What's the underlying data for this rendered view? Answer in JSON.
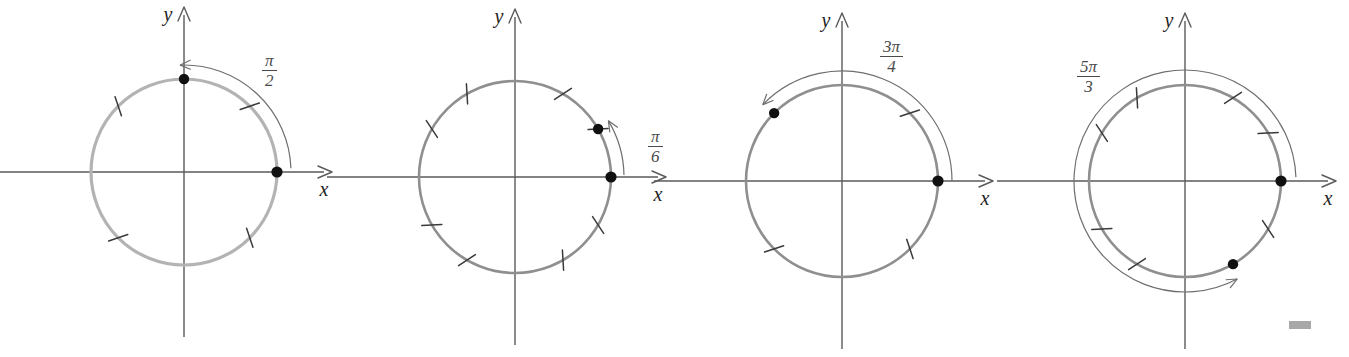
{
  "figure": {
    "background_color": "#ffffff",
    "axis_color": "#5a5a5a",
    "circle_color": "#b3b3b3",
    "point_color": "#111111",
    "arc_color": "#6e6e6e"
  },
  "panels": [
    {
      "id": "panel-1",
      "x_axis_label": "x",
      "y_axis_label": "y",
      "angle_numerator": "π",
      "angle_denominator": "2",
      "angle_label": "π/2",
      "angle_degrees": 90,
      "direction": "counterclockwise",
      "tick_degrees": [
        45,
        135,
        225,
        315
      ],
      "points_degrees": [
        0,
        90
      ],
      "center": {
        "x": 184,
        "y": 172
      },
      "radius": 93,
      "label_position": {
        "x": 262,
        "y": 52
      }
    },
    {
      "id": "panel-2",
      "x_axis_label": "x",
      "y_axis_label": "y",
      "angle_numerator": "π",
      "angle_denominator": "6",
      "angle_label": "π/6",
      "angle_degrees": 30,
      "direction": "counterclockwise",
      "tick_degrees": [
        30,
        60,
        120,
        150,
        210,
        240,
        300,
        330
      ],
      "points_degrees": [
        0,
        30
      ],
      "center": {
        "x": 515,
        "y": 177
      },
      "radius": 96,
      "label_position": {
        "x": 648,
        "y": 128
      }
    },
    {
      "id": "panel-3",
      "x_axis_label": "x",
      "y_axis_label": "y",
      "angle_numerator": "3π",
      "angle_denominator": "4",
      "angle_label": "3π/4",
      "angle_degrees": 135,
      "direction": "counterclockwise",
      "tick_degrees": [
        45,
        225,
        315
      ],
      "points_degrees": [
        0,
        135
      ],
      "center": {
        "x": 842,
        "y": 181
      },
      "radius": 96,
      "label_position": {
        "x": 880,
        "y": 38
      }
    },
    {
      "id": "panel-4",
      "x_axis_label": "x",
      "y_axis_label": "y",
      "angle_numerator": "5π",
      "angle_denominator": "3",
      "angle_label": "5π/3",
      "angle_degrees": 300,
      "direction": "counterclockwise",
      "tick_degrees": [
        30,
        60,
        120,
        150,
        210,
        240,
        330
      ],
      "points_degrees": [
        0,
        300
      ],
      "center": {
        "x": 1185,
        "y": 181
      },
      "radius": 96,
      "label_position": {
        "x": 1077,
        "y": 58
      }
    }
  ],
  "artifacts": {
    "gray_mark": {
      "x": 1289,
      "y": 321,
      "width": 22,
      "height": 8,
      "color": "#a8a8a8"
    }
  }
}
